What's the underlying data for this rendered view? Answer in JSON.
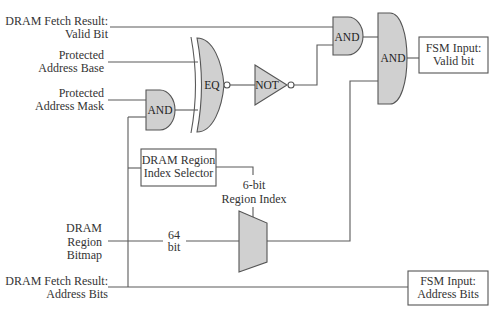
{
  "inputs": {
    "valid_bit": {
      "line1": "DRAM Fetch Result:",
      "line2": "Valid Bit"
    },
    "address_base": {
      "line1": "Protected",
      "line2": "Address Base"
    },
    "address_mask": {
      "line1": "Protected",
      "line2": "Address Mask"
    },
    "region_bitmap": {
      "line1": "DRAM",
      "line2": "Region",
      "line3": "Bitmap"
    },
    "address_bits": {
      "line1": "DRAM Fetch Result:",
      "line2": "Address Bits"
    }
  },
  "gates": {
    "mask_and": "AND",
    "eq": "EQ",
    "not": "NOT",
    "valid_and": "AND",
    "final_and": "AND"
  },
  "blocks": {
    "region_selector": {
      "line1": "DRAM Region",
      "line2": "Index Selector"
    }
  },
  "wire_labels": {
    "bitmap_width": {
      "line1": "64",
      "line2": "bit"
    },
    "region_index": {
      "line1": "6-bit",
      "line2": "Region Index"
    }
  },
  "outputs": {
    "valid_bit": {
      "line1": "FSM Input:",
      "line2": "Valid bit"
    },
    "address_bits": {
      "line1": "FSM Input:",
      "line2": "Address Bits"
    }
  },
  "colors": {
    "gate_fill": "#d0d0d0",
    "stroke": "#555555",
    "text": "#333333"
  }
}
